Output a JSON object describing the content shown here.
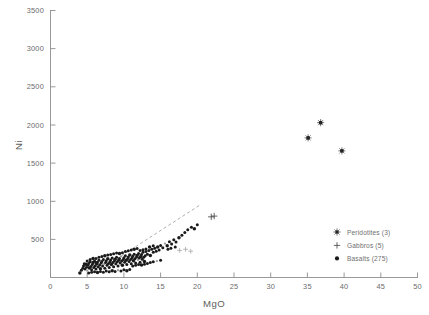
{
  "chart_data": {
    "type": "scatter",
    "title": "",
    "xlabel": "MgO",
    "ylabel": "Ni",
    "xlim": [
      0,
      50
    ],
    "ylim": [
      0,
      3500
    ],
    "xticks": [
      0,
      5,
      10,
      15,
      20,
      25,
      30,
      35,
      40,
      45,
      50
    ],
    "yticks": [
      0,
      500,
      1000,
      1500,
      2000,
      2500,
      3000,
      3500
    ],
    "grid": false,
    "legend_position": "lower-right-inside",
    "annotations": [
      "dashed trend line through basalt array"
    ],
    "series": [
      {
        "name": "Peridotites (3)",
        "label": "Peridotites",
        "count": 3,
        "marker": "star",
        "color": "#111111",
        "points": [
          [
            35.1,
            1830
          ],
          [
            36.8,
            2030
          ],
          [
            39.7,
            1660
          ]
        ]
      },
      {
        "name": "Gabbros (5)",
        "label": "Gabbros",
        "count": 5,
        "marker": "plus",
        "color": "#4a4a4a",
        "points": [
          [
            17.6,
            355
          ],
          [
            18.4,
            370
          ],
          [
            19.1,
            345
          ],
          [
            21.9,
            795
          ],
          [
            22.3,
            805
          ]
        ]
      },
      {
        "name": "Basalts (275)",
        "label": "Basalts",
        "count": 275,
        "marker": "circle",
        "color": "#1a1a1a",
        "points": [
          [
            4.0,
            60
          ],
          [
            4.2,
            95
          ],
          [
            4.4,
            120
          ],
          [
            4.5,
            150
          ],
          [
            4.7,
            110
          ],
          [
            4.8,
            175
          ],
          [
            4.9,
            135
          ],
          [
            5.0,
            90
          ],
          [
            5.1,
            160
          ],
          [
            5.2,
            185
          ],
          [
            5.3,
            125
          ],
          [
            5.4,
            205
          ],
          [
            5.5,
            145
          ],
          [
            5.6,
            100
          ],
          [
            5.7,
            170
          ],
          [
            5.8,
            195
          ],
          [
            5.9,
            130
          ],
          [
            6.0,
            215
          ],
          [
            6.1,
            155
          ],
          [
            6.2,
            110
          ],
          [
            6.3,
            180
          ],
          [
            6.4,
            200
          ],
          [
            6.5,
            140
          ],
          [
            6.6,
            225
          ],
          [
            6.7,
            165
          ],
          [
            6.8,
            115
          ],
          [
            6.9,
            190
          ],
          [
            7.0,
            210
          ],
          [
            7.1,
            150
          ],
          [
            7.2,
            235
          ],
          [
            7.3,
            175
          ],
          [
            7.4,
            120
          ],
          [
            7.5,
            195
          ],
          [
            7.6,
            220
          ],
          [
            7.7,
            160
          ],
          [
            7.8,
            245
          ],
          [
            7.9,
            185
          ],
          [
            8.0,
            130
          ],
          [
            8.1,
            205
          ],
          [
            8.2,
            230
          ],
          [
            8.3,
            170
          ],
          [
            8.4,
            255
          ],
          [
            8.5,
            195
          ],
          [
            8.6,
            140
          ],
          [
            8.7,
            215
          ],
          [
            8.8,
            240
          ],
          [
            8.9,
            180
          ],
          [
            9.0,
            265
          ],
          [
            9.1,
            205
          ],
          [
            9.2,
            150
          ],
          [
            9.3,
            225
          ],
          [
            9.4,
            250
          ],
          [
            9.5,
            190
          ],
          [
            9.6,
            275
          ],
          [
            9.7,
            215
          ],
          [
            9.8,
            160
          ],
          [
            9.9,
            235
          ],
          [
            10.0,
            260
          ],
          [
            10.1,
            200
          ],
          [
            10.2,
            285
          ],
          [
            10.3,
            225
          ],
          [
            10.4,
            170
          ],
          [
            10.5,
            245
          ],
          [
            10.6,
            270
          ],
          [
            10.7,
            210
          ],
          [
            10.8,
            295
          ],
          [
            10.9,
            235
          ],
          [
            11.0,
            180
          ],
          [
            11.1,
            255
          ],
          [
            11.2,
            280
          ],
          [
            11.3,
            220
          ],
          [
            11.4,
            305
          ],
          [
            11.5,
            245
          ],
          [
            11.6,
            190
          ],
          [
            11.7,
            265
          ],
          [
            11.8,
            290
          ],
          [
            11.9,
            230
          ],
          [
            12.0,
            315
          ],
          [
            12.1,
            255
          ],
          [
            12.2,
            200
          ],
          [
            12.3,
            275
          ],
          [
            12.4,
            300
          ],
          [
            12.5,
            240
          ],
          [
            12.6,
            330
          ],
          [
            12.7,
            265
          ],
          [
            12.8,
            210
          ],
          [
            12.9,
            285
          ],
          [
            13.0,
            340
          ],
          [
            13.2,
            305
          ],
          [
            13.4,
            355
          ],
          [
            13.6,
            290
          ],
          [
            13.8,
            370
          ],
          [
            14.0,
            330
          ],
          [
            14.2,
            385
          ],
          [
            14.4,
            345
          ],
          [
            14.6,
            400
          ],
          [
            14.8,
            360
          ],
          [
            15.0,
            420
          ],
          [
            15.3,
            390
          ],
          [
            15.6,
            445
          ],
          [
            15.9,
            415
          ],
          [
            16.2,
            470
          ],
          [
            16.5,
            440
          ],
          [
            16.8,
            495
          ],
          [
            17.1,
            465
          ],
          [
            17.5,
            520
          ],
          [
            17.9,
            555
          ],
          [
            18.3,
            590
          ],
          [
            18.7,
            625
          ],
          [
            19.2,
            660
          ],
          [
            19.6,
            640
          ],
          [
            20.0,
            690
          ],
          [
            5.2,
            60
          ],
          [
            5.6,
            70
          ],
          [
            6.0,
            75
          ],
          [
            6.4,
            65
          ],
          [
            6.8,
            80
          ],
          [
            7.2,
            70
          ],
          [
            7.6,
            85
          ],
          [
            8.0,
            75
          ],
          [
            8.4,
            90
          ],
          [
            8.8,
            80
          ],
          [
            9.2,
            95
          ],
          [
            9.6,
            85
          ],
          [
            10.0,
            100
          ],
          [
            10.4,
            90
          ],
          [
            10.8,
            105
          ],
          [
            6.2,
            250
          ],
          [
            6.6,
            265
          ],
          [
            7.0,
            275
          ],
          [
            7.4,
            285
          ],
          [
            7.8,
            295
          ],
          [
            8.2,
            300
          ],
          [
            8.6,
            310
          ],
          [
            9.0,
            320
          ],
          [
            9.4,
            315
          ],
          [
            9.8,
            325
          ],
          [
            11.2,
            150
          ],
          [
            11.6,
            160
          ],
          [
            12.0,
            170
          ],
          [
            12.4,
            165
          ],
          [
            12.8,
            175
          ],
          [
            13.2,
            185
          ],
          [
            13.6,
            195
          ],
          [
            14.0,
            205
          ],
          [
            14.5,
            215
          ],
          [
            15.0,
            225
          ],
          [
            4.6,
            180
          ],
          [
            5.0,
            215
          ],
          [
            5.4,
            235
          ],
          [
            5.8,
            250
          ],
          [
            6.2,
            195
          ],
          [
            10.2,
            340
          ],
          [
            10.6,
            350
          ],
          [
            11.0,
            360
          ],
          [
            11.4,
            370
          ],
          [
            11.8,
            380
          ],
          [
            12.2,
            355
          ],
          [
            12.6,
            365
          ],
          [
            13.0,
            375
          ],
          [
            13.5,
            400
          ],
          [
            14.0,
            415
          ],
          [
            16.0,
            370
          ],
          [
            16.4,
            385
          ],
          [
            17.0,
            400
          ]
        ]
      }
    ]
  },
  "axes": {
    "y_tick_labels": [
      "3500",
      "3000",
      "2500",
      "2000",
      "1500",
      "1000",
      "500",
      ""
    ],
    "x_tick_labels": [
      "0",
      "5",
      "10",
      "15",
      "20",
      "25",
      "30",
      "35",
      "40",
      "45",
      "50"
    ],
    "x_title": "MgO",
    "y_title": "Ni"
  },
  "legend": {
    "items": [
      {
        "label": "Peridotites  (3)",
        "marker": "star"
      },
      {
        "label": "Gabbros  (5)",
        "marker": "plus"
      },
      {
        "label": "Basalts  (275)",
        "marker": "circle"
      }
    ]
  }
}
